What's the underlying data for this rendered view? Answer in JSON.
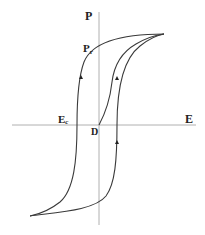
{
  "diagram": {
    "type": "ferroelectric-hysteresis-loop",
    "labels": {
      "y_axis": "P",
      "x_axis": "E",
      "remanent_base": "P",
      "remanent_sub": "r",
      "coercive_base": "E",
      "coercive_sub": "c",
      "origin": "D"
    },
    "colors": {
      "curve": "#3a3a3a",
      "axis": "#b0b0b0",
      "text": "#222222"
    }
  }
}
